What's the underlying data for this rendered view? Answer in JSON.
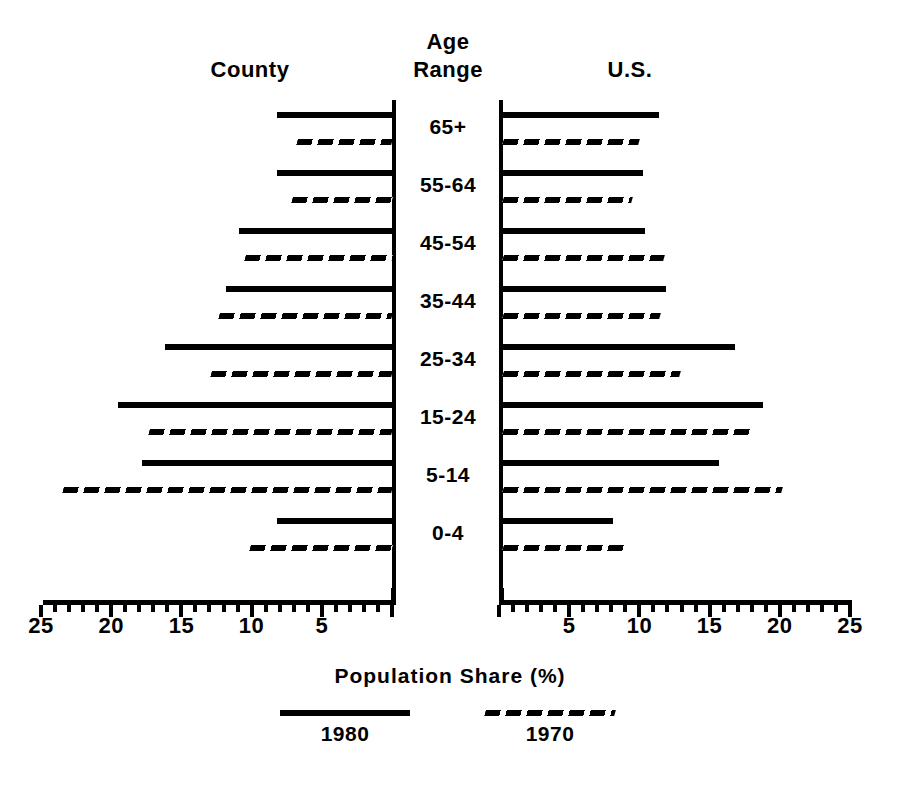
{
  "headers": {
    "left_column": "County",
    "center_column_line1": "Age",
    "center_column_line2": "Range",
    "right_column": "U.S."
  },
  "axis": {
    "title": "Population Share (%)",
    "max": 25,
    "min": 0,
    "major_step": 5,
    "minor_step": 1,
    "left_tick_labels": [
      "25",
      "20",
      "15",
      "10",
      "5"
    ],
    "right_tick_labels": [
      "5",
      "10",
      "15",
      "20",
      "25"
    ],
    "grid": false
  },
  "legend": {
    "position": "bottom",
    "entries": [
      {
        "label": "1980",
        "style": "solid",
        "color": "#000000"
      },
      {
        "label": "1970",
        "style": "dashed",
        "color": "#000000"
      }
    ]
  },
  "colors": {
    "ink": "#000000",
    "paper": "#ffffff"
  },
  "chart_data": {
    "type": "bar",
    "title": "Population Share (%)",
    "subtitle": "",
    "xlabel": "Population Share (%)",
    "ylabel": "Age Range",
    "xlim": [
      0,
      25
    ],
    "grid": false,
    "legend_position": "bottom",
    "orientation": "horizontal-diverging",
    "panels": [
      "County",
      "U.S."
    ],
    "categories": [
      "65+",
      "55-64",
      "45-54",
      "35-44",
      "25-34",
      "15-24",
      "5-14",
      "0-4"
    ],
    "series": [
      {
        "name": "County 1980",
        "panel": "County",
        "style": "solid",
        "values": [
          8.2,
          8.2,
          10.9,
          11.8,
          16.2,
          19.5,
          17.8,
          8.2
        ]
      },
      {
        "name": "County 1970",
        "panel": "County",
        "style": "dashed",
        "values": [
          6.8,
          7.1,
          10.5,
          12.3,
          12.9,
          17.3,
          23.4,
          10.1
        ]
      },
      {
        "name": "U.S. 1980",
        "panel": "U.S.",
        "style": "solid",
        "values": [
          11.1,
          10.0,
          10.1,
          11.6,
          16.5,
          18.5,
          15.4,
          7.8
        ]
      },
      {
        "name": "U.S. 1970",
        "panel": "U.S.",
        "style": "dashed",
        "values": [
          9.7,
          9.2,
          11.5,
          11.2,
          12.6,
          17.7,
          19.9,
          8.8
        ]
      }
    ]
  }
}
